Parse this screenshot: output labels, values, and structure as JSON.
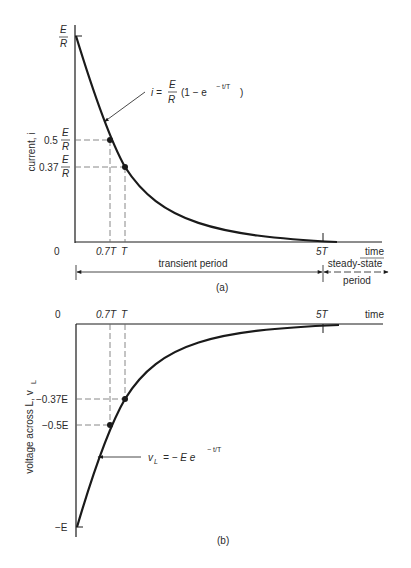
{
  "figure_a": {
    "caption": "(a)",
    "y_axis_label": "current, i",
    "x_axis_label": "time",
    "origin_label": "0",
    "y_ticks": [
      {
        "prefix": "",
        "num": "E",
        "den": "R",
        "value": 1.0
      },
      {
        "prefix": "0.5",
        "num": "E",
        "den": "R",
        "value": 0.5
      },
      {
        "prefix": "0.37",
        "num": "E",
        "den": "R",
        "value": 0.37
      }
    ],
    "x_ticks": [
      {
        "label": "0.7T",
        "value": 0.7
      },
      {
        "label": "T",
        "value": 1.0
      },
      {
        "label": "5T",
        "value": 5.0
      }
    ],
    "equation": {
      "lhs": "i =",
      "num": "E",
      "den": "R",
      "body": "(1 − e",
      "exponent": "− t/T",
      "close": ")"
    },
    "periods": {
      "transient": "transient period",
      "steady_line1": "steady-state",
      "steady_line2": "period"
    }
  },
  "figure_b": {
    "caption": "(b)",
    "y_axis_label": "voltage across L, v",
    "y_axis_label_sub": "L",
    "x_axis_label": "time",
    "origin_label": "0",
    "y_ticks": [
      {
        "label": "−0.37E",
        "value": -0.37
      },
      {
        "label": "−0.5E",
        "value": -0.5
      },
      {
        "label": "−E",
        "value": -1.0
      }
    ],
    "x_ticks": [
      {
        "label": "0.7T",
        "value": 0.7
      },
      {
        "label": "T",
        "value": 1.0
      },
      {
        "label": "5T",
        "value": 5.0
      }
    ],
    "equation": {
      "lhs": "v",
      "lhs_sub": "L",
      "eq": "= − E e",
      "exponent": "− t/T"
    }
  },
  "colors": {
    "ink": "#1a1a1a",
    "dashed": "#6a6a6a",
    "background": "#ffffff"
  }
}
